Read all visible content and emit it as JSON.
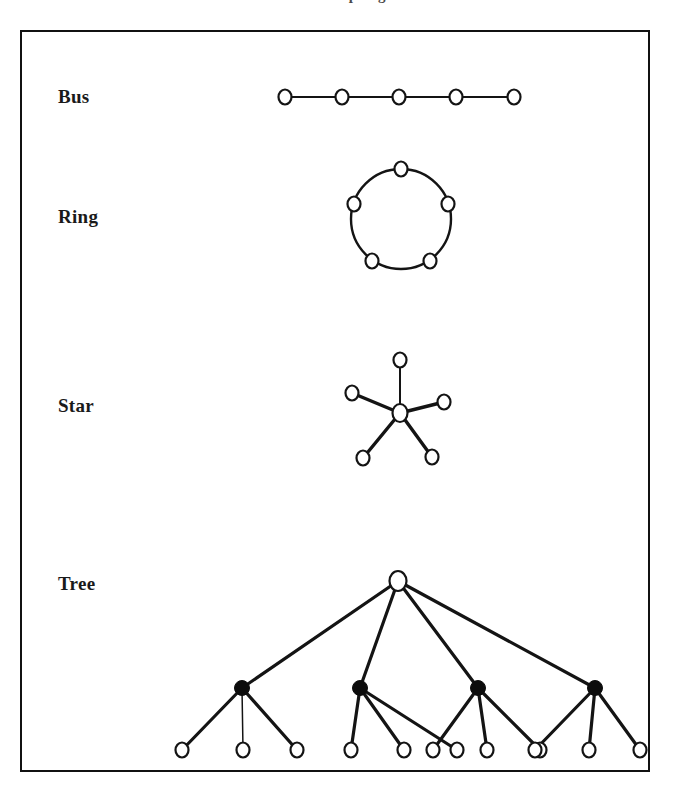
{
  "caption": {
    "text": "Network Topologies",
    "visible_fragment": "clipped at top edge of scan"
  },
  "figure": {
    "border_color": "#111111",
    "background_color": "#ffffff",
    "ink_color": "#141414",
    "rows": [
      {
        "id": "bus",
        "label": "Bus"
      },
      {
        "id": "ring",
        "label": "Ring"
      },
      {
        "id": "star",
        "label": "Star"
      },
      {
        "id": "tree",
        "label": "Tree"
      }
    ]
  },
  "chart_data": {
    "type": "diagram",
    "title": "Network Topologies",
    "diagrams": [
      {
        "name": "Bus",
        "label": "Bus",
        "node_count": 5,
        "node_style": "open-circle",
        "edge_count": 4,
        "layout": "horizontal-chain",
        "nodes": [
          {
            "id": "b1",
            "x": 285,
            "y": 97,
            "filled": false
          },
          {
            "id": "b2",
            "x": 342,
            "y": 97,
            "filled": false
          },
          {
            "id": "b3",
            "x": 399,
            "y": 97,
            "filled": false
          },
          {
            "id": "b4",
            "x": 456,
            "y": 97,
            "filled": false
          },
          {
            "id": "b5",
            "x": 514,
            "y": 97,
            "filled": false
          }
        ],
        "edges": [
          [
            "b1",
            "b2"
          ],
          [
            "b2",
            "b3"
          ],
          [
            "b3",
            "b4"
          ],
          [
            "b4",
            "b5"
          ]
        ]
      },
      {
        "name": "Ring",
        "label": "Ring",
        "node_count": 5,
        "node_style": "open-circle",
        "edge_count": 5,
        "layout": "circular",
        "center": {
          "x": 401,
          "y": 219
        },
        "radius": 50,
        "nodes": [
          {
            "id": "r1",
            "x": 401,
            "y": 169,
            "filled": false,
            "angle_deg": 270
          },
          {
            "id": "r2",
            "x": 448,
            "y": 204,
            "filled": false,
            "angle_deg": 324
          },
          {
            "id": "r3",
            "x": 430,
            "y": 261,
            "filled": false,
            "angle_deg": 36
          },
          {
            "id": "r4",
            "x": 372,
            "y": 261,
            "filled": false,
            "angle_deg": 108
          },
          {
            "id": "r5",
            "x": 354,
            "y": 204,
            "filled": false,
            "angle_deg": 216
          }
        ],
        "edges": [
          [
            "r1",
            "r2"
          ],
          [
            "r2",
            "r3"
          ],
          [
            "r3",
            "r4"
          ],
          [
            "r4",
            "r5"
          ],
          [
            "r5",
            "r1"
          ]
        ]
      },
      {
        "name": "Star",
        "label": "Star",
        "node_count": 6,
        "hub_count": 1,
        "leaf_count": 5,
        "node_style": "open-circle",
        "edge_count": 5,
        "layout": "radial",
        "nodes": [
          {
            "id": "s0",
            "x": 400,
            "y": 413,
            "filled": false,
            "role": "hub"
          },
          {
            "id": "s1",
            "x": 400,
            "y": 360,
            "filled": false,
            "role": "leaf"
          },
          {
            "id": "s2",
            "x": 444,
            "y": 402,
            "filled": false,
            "role": "leaf"
          },
          {
            "id": "s3",
            "x": 432,
            "y": 457,
            "filled": false,
            "role": "leaf"
          },
          {
            "id": "s4",
            "x": 363,
            "y": 458,
            "filled": false,
            "role": "leaf"
          },
          {
            "id": "s5",
            "x": 352,
            "y": 393,
            "filled": false,
            "role": "leaf"
          }
        ],
        "edges": [
          [
            "s0",
            "s1"
          ],
          [
            "s0",
            "s2"
          ],
          [
            "s0",
            "s3"
          ],
          [
            "s0",
            "s4"
          ],
          [
            "s0",
            "s5"
          ]
        ]
      },
      {
        "name": "Tree",
        "label": "Tree",
        "node_count": 17,
        "levels": 3,
        "root_count": 1,
        "branch_count": 4,
        "leaf_count": 12,
        "node_style": "open-circle root and leaves, filled-circle branches",
        "edge_count": 16,
        "layout": "hierarchical",
        "nodes": [
          {
            "id": "t0",
            "x": 398,
            "y": 581,
            "filled": false,
            "level": 0,
            "role": "root"
          },
          {
            "id": "t1",
            "x": 242,
            "y": 688,
            "filled": true,
            "level": 1,
            "role": "branch"
          },
          {
            "id": "t2",
            "x": 360,
            "y": 688,
            "filled": true,
            "level": 1,
            "role": "branch"
          },
          {
            "id": "t3",
            "x": 478,
            "y": 688,
            "filled": true,
            "level": 1,
            "role": "branch"
          },
          {
            "id": "t4",
            "x": 595,
            "y": 688,
            "filled": true,
            "level": 1,
            "role": "branch"
          },
          {
            "id": "l1",
            "x": 182,
            "y": 750,
            "filled": false,
            "level": 2,
            "role": "leaf"
          },
          {
            "id": "l2",
            "x": 243,
            "y": 750,
            "filled": false,
            "level": 2,
            "role": "leaf"
          },
          {
            "id": "l3",
            "x": 297,
            "y": 750,
            "filled": false,
            "level": 2,
            "role": "leaf"
          },
          {
            "id": "l4",
            "x": 351,
            "y": 750,
            "filled": false,
            "level": 2,
            "role": "leaf"
          },
          {
            "id": "l5",
            "x": 404,
            "y": 750,
            "filled": false,
            "level": 2,
            "role": "leaf"
          },
          {
            "id": "l6",
            "x": 457,
            "y": 750,
            "filled": false,
            "level": 2,
            "role": "leaf"
          },
          {
            "id": "l7",
            "x": 433,
            "y": 750,
            "filled": false,
            "level": 2,
            "role": "leaf"
          },
          {
            "id": "l8",
            "x": 487,
            "y": 750,
            "filled": false,
            "level": 2,
            "role": "leaf"
          },
          {
            "id": "l9",
            "x": 540,
            "y": 750,
            "filled": false,
            "level": 2,
            "role": "leaf"
          },
          {
            "id": "l10",
            "x": 535,
            "y": 750,
            "filled": false,
            "level": 2,
            "role": "leaf"
          },
          {
            "id": "l11",
            "x": 589,
            "y": 750,
            "filled": false,
            "level": 2,
            "role": "leaf"
          },
          {
            "id": "l12",
            "x": 640,
            "y": 750,
            "filled": false,
            "level": 2,
            "role": "leaf"
          }
        ],
        "edges": [
          [
            "t0",
            "t1"
          ],
          [
            "t0",
            "t2"
          ],
          [
            "t0",
            "t3"
          ],
          [
            "t0",
            "t4"
          ],
          [
            "t1",
            "l1"
          ],
          [
            "t1",
            "l2"
          ],
          [
            "t1",
            "l3"
          ],
          [
            "t2",
            "l4"
          ],
          [
            "t2",
            "l5"
          ],
          [
            "t2",
            "l6"
          ],
          [
            "t3",
            "l7"
          ],
          [
            "t3",
            "l8"
          ],
          [
            "t3",
            "l9"
          ],
          [
            "t4",
            "l10"
          ],
          [
            "t4",
            "l11"
          ],
          [
            "t4",
            "l12"
          ]
        ]
      }
    ]
  }
}
